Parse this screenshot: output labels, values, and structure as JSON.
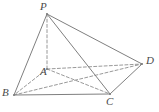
{
  "figure": {
    "name": "solid-geometry-pyramid",
    "background_color": "#ffffff",
    "stroke_color": "#7f7f7f",
    "label_color": "#4a4a4a",
    "width": 159,
    "height": 112
  },
  "vertices": [
    {
      "id": "P",
      "label": "P",
      "x": 47,
      "y": 14,
      "label_x": 40,
      "label_y": 1,
      "hidden": false
    },
    {
      "id": "A",
      "label": "A",
      "x": 47,
      "y": 69,
      "label_x": 40,
      "label_y": 66,
      "hidden": true
    },
    {
      "id": "B",
      "label": "B",
      "x": 14,
      "y": 95,
      "label_x": 2,
      "label_y": 87,
      "hidden": false
    },
    {
      "id": "C",
      "label": "C",
      "x": 110,
      "y": 94,
      "label_x": 106,
      "label_y": 96,
      "hidden": false
    },
    {
      "id": "D",
      "label": "D",
      "x": 142,
      "y": 64,
      "label_x": 146,
      "label_y": 55,
      "hidden": false
    }
  ],
  "edges": [
    {
      "id": "PB",
      "from": "P",
      "to": "B",
      "style": "solid"
    },
    {
      "id": "PC",
      "from": "P",
      "to": "C",
      "style": "solid"
    },
    {
      "id": "PD",
      "from": "P",
      "to": "D",
      "style": "solid"
    },
    {
      "id": "BC",
      "from": "B",
      "to": "C",
      "style": "solid"
    },
    {
      "id": "CD",
      "from": "C",
      "to": "D",
      "style": "solid"
    },
    {
      "id": "PA",
      "from": "P",
      "to": "A",
      "style": "dashed"
    },
    {
      "id": "AB",
      "from": "A",
      "to": "B",
      "style": "dashed"
    },
    {
      "id": "AC",
      "from": "A",
      "to": "C",
      "style": "dashed"
    },
    {
      "id": "AD",
      "from": "A",
      "to": "D",
      "style": "dashed"
    },
    {
      "id": "BD",
      "from": "B",
      "to": "D",
      "style": "dashed"
    }
  ],
  "labels": {
    "P": "P",
    "A": "A",
    "B": "B",
    "C": "C",
    "D": "D"
  }
}
